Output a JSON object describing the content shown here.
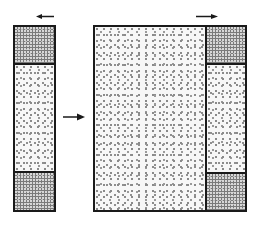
{
  "diagram": {
    "left_column": {
      "segments": [
        {
          "label": "",
          "pattern": "dense"
        },
        {
          "label": "",
          "pattern": "sparse"
        },
        {
          "label": "",
          "pattern": "dense"
        }
      ],
      "top_arrow": {
        "direction": "left"
      }
    },
    "transition_arrow": {
      "direction": "right"
    },
    "right_figure": {
      "main_region": {
        "pattern": "sparse"
      },
      "side_column": {
        "segments": [
          {
            "label": "",
            "pattern": "dense"
          },
          {
            "label": "",
            "pattern": "sparse"
          },
          {
            "label": "",
            "pattern": "dense"
          }
        ]
      },
      "top_arrow": {
        "direction": "right"
      }
    },
    "colors": {
      "outline": "#1a1a1a",
      "dense_fill": "#7a7a7a",
      "sparse_dots": "#8a8a8a",
      "background": "#ffffff"
    }
  }
}
